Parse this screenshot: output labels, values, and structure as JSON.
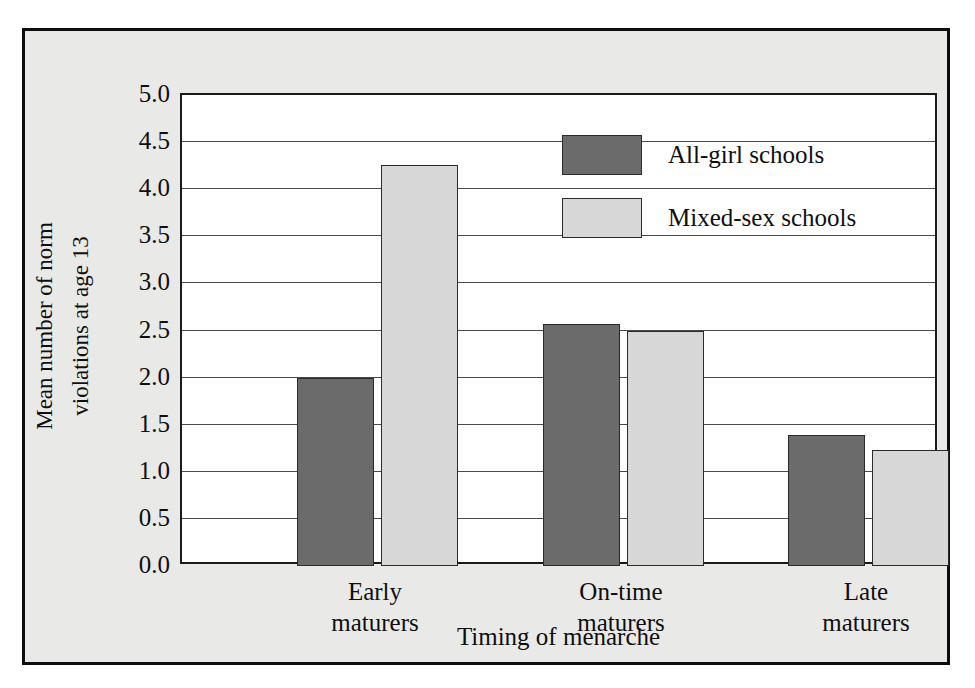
{
  "chart_data": {
    "type": "bar",
    "title": "",
    "xlabel": "Timing of menarche",
    "ylabel_line1": "Mean number of norm",
    "ylabel_line2": "violations at age 13",
    "categories": [
      "Early maturers",
      "On-time maturers",
      "Late maturers"
    ],
    "category_lines": [
      [
        "Early",
        "maturers"
      ],
      [
        "On-time",
        "maturers"
      ],
      [
        "Late",
        "maturers"
      ]
    ],
    "series": [
      {
        "name": "All-girl schools",
        "color": "#6b6b6b",
        "values": [
          2.0,
          2.57,
          1.39
        ]
      },
      {
        "name": "Mixed-sex schools",
        "color": "#d7d7d7",
        "values": [
          4.26,
          2.5,
          1.23
        ]
      }
    ],
    "ylim": [
      0.0,
      5.0
    ],
    "ytick_values": [
      5.0,
      4.5,
      4.0,
      3.5,
      3.0,
      2.5,
      2.0,
      1.5,
      1.0,
      0.5,
      0.0
    ],
    "ytick_labels": [
      "5.0",
      "4.5",
      "4.0",
      "3.5",
      "3.0",
      "2.5",
      "2.0",
      "1.5",
      "1.0",
      "0.5",
      "0.0"
    ],
    "grid": true,
    "legend_position": "upper-center",
    "legend": [
      "All-girl schools",
      "Mixed-sex schools"
    ],
    "colors": {
      "figure_background": "#e9e9e7",
      "plot_background": "#ffffff",
      "frame": "#0d0d0d",
      "gridline": "#4a4a4a",
      "series_all_girl": "#6b6b6b",
      "series_mixed_sex": "#d7d7d7"
    }
  }
}
